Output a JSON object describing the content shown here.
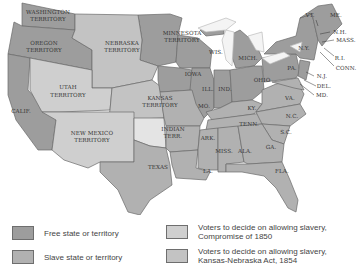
{
  "colors": {
    "free": "#9d9d9d",
    "slave": "#b1b1b1",
    "compromise_1850": "#cfcfcf",
    "kansas_nebraska_1854": "#c3c3c3",
    "indian": "#e4e4e4",
    "lakes": "#f4f4f4",
    "border": "#6a6a6a"
  },
  "map": {
    "labels": {
      "washington": [
        "WASHINGTON",
        "TERRITORY"
      ],
      "oregon": [
        "OREGON",
        "TERRITORY"
      ],
      "nebraska": [
        "NEBRASKA",
        "TERRITORY"
      ],
      "minnesota": [
        "MINNESOTA",
        "TERRITORY"
      ],
      "utah": [
        "UTAH",
        "TERRITORY"
      ],
      "kansas": [
        "KANSAS",
        "TERRITORY"
      ],
      "new_mexico": [
        "NEW MEXICO",
        "TERRITORY"
      ],
      "indian": [
        "INDIAN",
        "TERR."
      ],
      "calif": "CALIF.",
      "texas": "TEXAS",
      "wis": "WIS.",
      "mich": "MICH.",
      "iowa": "IOWA",
      "ill": "ILL.",
      "ind": "IND.",
      "ohio": "OHIO",
      "mo": "MO.",
      "ky": "KY.",
      "tenn": "TENN.",
      "ark": "ARK.",
      "miss": "MISS.",
      "ala": "ALA.",
      "ga": "GA.",
      "la": "LA.",
      "fla": "FLA.",
      "sc": "S.C.",
      "nc": "N.C.",
      "va": "VA.",
      "pa": "PA.",
      "ny": "N.Y.",
      "vt": "VT.",
      "me": "ME.",
      "nh": "N.H.",
      "mass": "MASS.",
      "ri": "R.I.",
      "conn": "CONN.",
      "nj": "N.J.",
      "del": "DEL.",
      "md": "MD."
    }
  },
  "legend": {
    "items": [
      {
        "key": "free",
        "label": "Free state or territory"
      },
      {
        "key": "slave",
        "label": "Slave state or territory"
      },
      {
        "key": "compromise_1850",
        "label_line1": "Voters to decide on allowing slavery,",
        "label_line2": "Compromise of 1850"
      },
      {
        "key": "kansas_nebraska_1854",
        "label_line1": "Voters to decide on allowing slavery,",
        "label_line2": "Kansas-Nebraska Act, 1854"
      }
    ]
  }
}
